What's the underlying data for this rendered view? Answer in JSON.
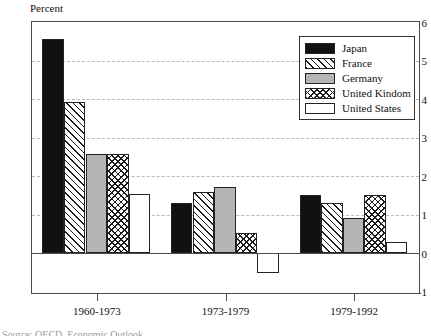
{
  "chart_data": {
    "type": "bar",
    "title": "",
    "ylabel": "Percent",
    "xlabel": "",
    "ylim": [
      -1,
      6
    ],
    "yticks": [
      6,
      5,
      4,
      3,
      2,
      1,
      0,
      -1
    ],
    "ytick_labels": [
      "6",
      "5",
      "4",
      "3",
      "2",
      "1",
      "0",
      "-1"
    ],
    "grid": true,
    "gridlines_at": [
      5,
      4,
      3,
      2,
      1
    ],
    "legend_position": "top-right",
    "categories": [
      "1960-1973",
      "1973-1979",
      "1979-1992"
    ],
    "series": [
      {
        "name": "Japan",
        "pattern": "solid-black",
        "values": [
          5.55,
          1.3,
          1.5
        ]
      },
      {
        "name": "France",
        "pattern": "diagonal-hatch",
        "values": [
          3.92,
          1.6,
          1.3
        ]
      },
      {
        "name": "Germany",
        "pattern": "solid-gray",
        "values": [
          2.58,
          1.72,
          0.92
        ]
      },
      {
        "name": "United Kindom",
        "pattern": "cross-hatch",
        "values": [
          2.58,
          0.52,
          1.5
        ]
      },
      {
        "name": "United States",
        "pattern": "white-empty",
        "values": [
          1.53,
          -0.5,
          0.28
        ]
      }
    ]
  },
  "axis": {
    "ylabel": "Percent",
    "tick_0": "6",
    "tick_1": "5",
    "tick_2": "4",
    "tick_3": "3",
    "tick_4": "2",
    "tick_5": "1",
    "tick_6": "0",
    "tick_7": "-1",
    "xlabel_0": "1960-1973",
    "xlabel_1": "1973-1979",
    "xlabel_2": "1979-1992"
  },
  "legend": {
    "items": [
      {
        "label": "Japan",
        "swatch": "solid-black"
      },
      {
        "label": "France",
        "swatch": "diagonal-hatch"
      },
      {
        "label": "Germany",
        "swatch": "solid-gray"
      },
      {
        "label": "United Kindom",
        "swatch": "cross-hatch"
      },
      {
        "label": "United States",
        "swatch": "white-empty"
      }
    ]
  },
  "footer": {
    "clipped_text": "Source:  OECD, Economic Outlook"
  },
  "colors": {
    "black_fill": "#111111",
    "gray_fill": "#b5b5b5",
    "white_fill": "#ffffff",
    "axis": "#4a4a4a",
    "grid": "#b9b9b9",
    "bar_outline": "#222222"
  }
}
